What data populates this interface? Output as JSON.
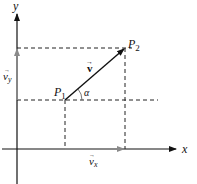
{
  "diagram": {
    "type": "vector-components",
    "axes": {
      "x_label": "x",
      "y_label": "y"
    },
    "points": {
      "p1": {
        "label": "P",
        "subscript": "1"
      },
      "p2": {
        "label": "P",
        "subscript": "2"
      }
    },
    "vector": {
      "label": "v",
      "arrow": "→"
    },
    "angle": {
      "label": "α"
    },
    "components": {
      "vx": {
        "label": "v",
        "subscript": "x",
        "arrow": "→"
      },
      "vy": {
        "label": "v",
        "subscript": "y",
        "arrow": "→"
      }
    },
    "colors": {
      "axis": "#111111",
      "vector": "#111111",
      "component": "#8a8a8a",
      "dashed": "#222222"
    }
  }
}
